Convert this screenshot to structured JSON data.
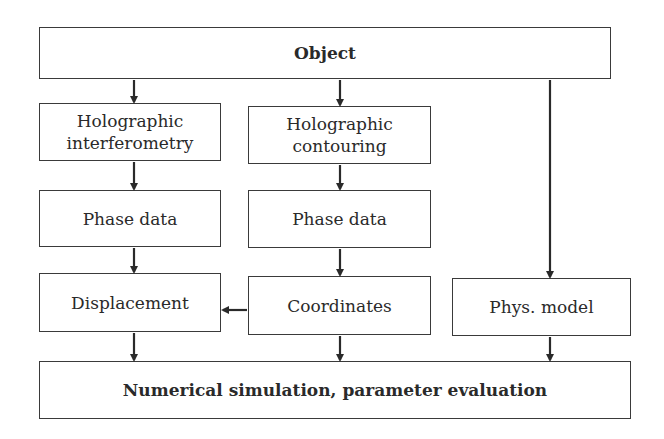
{
  "diagram": {
    "nodes": {
      "object": "Object",
      "holo_interferometry_1": "Holographic",
      "holo_interferometry_2": "interferometry",
      "holo_contouring_1": "Holographic",
      "holo_contouring_2": "contouring",
      "phase_data_left": "Phase data",
      "phase_data_right": "Phase data",
      "displacement": "Displacement",
      "coordinates": "Coordinates",
      "phys_model": "Phys. model",
      "numerical_simulation": "Numerical simulation, parameter evaluation"
    },
    "edges": [
      [
        "Object",
        "Holographic interferometry"
      ],
      [
        "Object",
        "Holographic contouring"
      ],
      [
        "Object",
        "Phys. model"
      ],
      [
        "Holographic interferometry",
        "Phase data (left)"
      ],
      [
        "Holographic contouring",
        "Phase data (right)"
      ],
      [
        "Phase data (left)",
        "Displacement"
      ],
      [
        "Phase data (right)",
        "Coordinates"
      ],
      [
        "Coordinates",
        "Displacement"
      ],
      [
        "Displacement",
        "Numerical simulation, parameter evaluation"
      ],
      [
        "Coordinates",
        "Numerical simulation, parameter evaluation"
      ],
      [
        "Phys. model",
        "Numerical simulation, parameter evaluation"
      ]
    ]
  }
}
